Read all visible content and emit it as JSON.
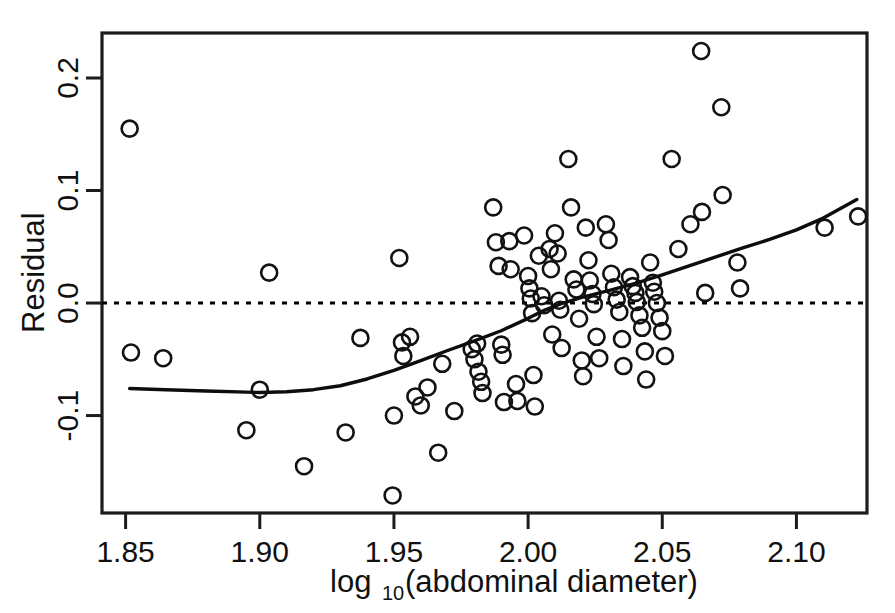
{
  "chart_data": {
    "type": "scatter",
    "title": "",
    "subtitle": "",
    "xlabel": "log10(abdominal diameter)",
    "xlabel_base": "log",
    "xlabel_sub": "10",
    "xlabel_rest": "(abdominal diameter)",
    "ylabel": "Residual",
    "xlim": [
      1.8412,
      2.1263
    ],
    "ylim": [
      -0.1866,
      0.24
    ],
    "xticks": [
      1.85,
      1.9,
      1.95,
      2.0,
      2.05,
      2.1
    ],
    "xtick_labels": [
      "1.85",
      "1.90",
      "1.95",
      "2.00",
      "2.05",
      "2.10"
    ],
    "yticks": [
      -0.1,
      0.0,
      0.1,
      0.2
    ],
    "ytick_labels": [
      "-0.1",
      "0.0",
      "0.1",
      "0.2"
    ],
    "grid": false,
    "legend": "none",
    "marker": "open-circle",
    "marker_radius_px": 8,
    "point_color": "#121212",
    "curve_color": "#0d0d0d",
    "reference_line": {
      "type": "horizontal",
      "y": 0.0,
      "style": "dotted"
    },
    "series": [
      {
        "name": "residuals",
        "points": [
          [
            1.8515,
            0.155
          ],
          [
            1.852,
            -0.044
          ],
          [
            1.864,
            -0.049
          ],
          [
            1.895,
            -0.113
          ],
          [
            1.9,
            -0.077
          ],
          [
            1.9035,
            0.027
          ],
          [
            1.9165,
            -0.145
          ],
          [
            1.932,
            -0.115
          ],
          [
            1.9375,
            -0.031
          ],
          [
            1.9495,
            -0.171
          ],
          [
            1.95,
            -0.1
          ],
          [
            1.952,
            0.04
          ],
          [
            1.953,
            -0.035
          ],
          [
            1.9535,
            -0.047
          ],
          [
            1.956,
            -0.03
          ],
          [
            1.958,
            -0.083
          ],
          [
            1.96,
            -0.091
          ],
          [
            1.9625,
            -0.075
          ],
          [
            1.9665,
            -0.133
          ],
          [
            1.968,
            -0.054
          ],
          [
            1.9725,
            -0.096
          ],
          [
            1.979,
            -0.041
          ],
          [
            1.98,
            -0.05
          ],
          [
            1.981,
            -0.036
          ],
          [
            1.9815,
            -0.061
          ],
          [
            1.9825,
            -0.07
          ],
          [
            1.983,
            -0.08
          ],
          [
            1.987,
            0.085
          ],
          [
            1.988,
            0.054
          ],
          [
            1.989,
            0.033
          ],
          [
            1.99,
            -0.037
          ],
          [
            1.9905,
            -0.046
          ],
          [
            1.991,
            -0.088
          ],
          [
            1.993,
            0.055
          ],
          [
            1.9935,
            0.03
          ],
          [
            1.9955,
            -0.072
          ],
          [
            1.996,
            -0.087
          ],
          [
            1.9985,
            0.06
          ],
          [
            2.0,
            0.024
          ],
          [
            2.0005,
            0.013
          ],
          [
            2.001,
            0.004
          ],
          [
            2.0015,
            -0.009
          ],
          [
            2.002,
            -0.064
          ],
          [
            2.0025,
            -0.092
          ],
          [
            2.004,
            0.042
          ],
          [
            2.005,
            0.006
          ],
          [
            2.006,
            -0.002
          ],
          [
            2.008,
            0.048
          ],
          [
            2.0085,
            0.03
          ],
          [
            2.009,
            -0.028
          ],
          [
            2.01,
            0.062
          ],
          [
            2.011,
            0.044
          ],
          [
            2.0115,
            0.002
          ],
          [
            2.012,
            -0.006
          ],
          [
            2.0125,
            -0.04
          ],
          [
            2.015,
            0.128
          ],
          [
            2.016,
            0.085
          ],
          [
            2.017,
            0.021
          ],
          [
            2.018,
            0.012
          ],
          [
            2.019,
            -0.014
          ],
          [
            2.02,
            -0.051
          ],
          [
            2.0205,
            -0.065
          ],
          [
            2.0215,
            0.067
          ],
          [
            2.0225,
            0.038
          ],
          [
            2.023,
            0.02
          ],
          [
            2.024,
            0.008
          ],
          [
            2.0245,
            -0.001
          ],
          [
            2.0255,
            -0.03
          ],
          [
            2.0265,
            -0.049
          ],
          [
            2.029,
            0.07
          ],
          [
            2.03,
            0.056
          ],
          [
            2.031,
            0.026
          ],
          [
            2.032,
            0.014
          ],
          [
            2.033,
            0.003
          ],
          [
            2.034,
            -0.008
          ],
          [
            2.035,
            -0.032
          ],
          [
            2.0355,
            -0.056
          ],
          [
            2.038,
            0.023
          ],
          [
            2.039,
            0.015
          ],
          [
            2.04,
            0.009
          ],
          [
            2.0405,
            0.001
          ],
          [
            2.0415,
            -0.011
          ],
          [
            2.0425,
            -0.022
          ],
          [
            2.0435,
            -0.043
          ],
          [
            2.044,
            -0.068
          ],
          [
            2.0455,
            0.036
          ],
          [
            2.0465,
            0.018
          ],
          [
            2.047,
            0.01
          ],
          [
            2.048,
            0.0
          ],
          [
            2.049,
            -0.013
          ],
          [
            2.05,
            -0.025
          ],
          [
            2.051,
            -0.047
          ],
          [
            2.0535,
            0.128
          ],
          [
            2.056,
            0.048
          ],
          [
            2.0605,
            0.07
          ],
          [
            2.0645,
            0.224
          ],
          [
            2.0648,
            0.081
          ],
          [
            2.066,
            0.009
          ],
          [
            2.072,
            0.174
          ],
          [
            2.0725,
            0.096
          ],
          [
            2.078,
            0.036
          ],
          [
            2.079,
            0.013
          ],
          [
            2.1105,
            0.067
          ],
          [
            2.123,
            0.077
          ]
        ]
      }
    ],
    "smoother": {
      "name": "loess",
      "points": [
        [
          1.8515,
          -0.076
        ],
        [
          1.865,
          -0.077
        ],
        [
          1.88,
          -0.0782
        ],
        [
          1.895,
          -0.0792
        ],
        [
          1.9,
          -0.0795
        ],
        [
          1.91,
          -0.0788
        ],
        [
          1.92,
          -0.077
        ],
        [
          1.93,
          -0.0735
        ],
        [
          1.94,
          -0.0675
        ],
        [
          1.95,
          -0.0598
        ],
        [
          1.96,
          -0.0512
        ],
        [
          1.97,
          -0.0422
        ],
        [
          1.98,
          -0.0336
        ],
        [
          1.99,
          -0.0246
        ],
        [
          2.0,
          -0.0136
        ],
        [
          2.006,
          -0.0065
        ],
        [
          2.013,
          0.0
        ],
        [
          2.02,
          0.0051
        ],
        [
          2.03,
          0.011
        ],
        [
          2.04,
          0.0175
        ],
        [
          2.05,
          0.025
        ],
        [
          2.06,
          0.033
        ],
        [
          2.07,
          0.041
        ],
        [
          2.08,
          0.049
        ],
        [
          2.09,
          0.0565
        ],
        [
          2.1,
          0.065
        ],
        [
          2.11,
          0.0755
        ],
        [
          2.1225,
          0.092
        ]
      ]
    }
  }
}
